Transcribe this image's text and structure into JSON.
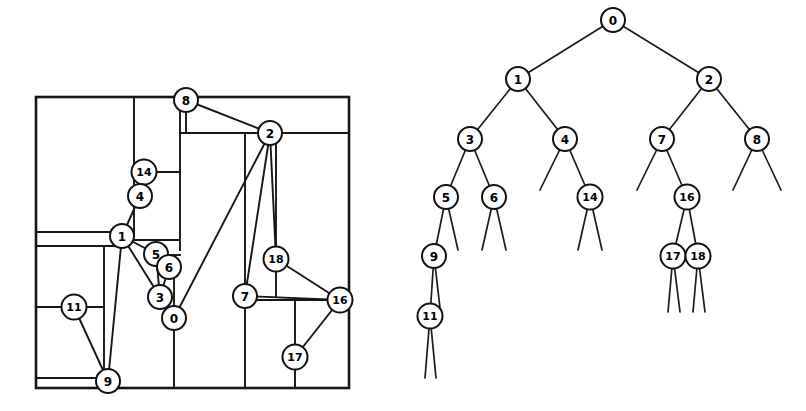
{
  "figure": {
    "width": 806,
    "height": 411,
    "background": "#ffffff",
    "ink_color": "#161616"
  },
  "layout_panel": {
    "name": "rectangular-dissection",
    "frame": {
      "x": 36,
      "y": 97,
      "width": 313,
      "height": 291
    },
    "partition_segments": [
      {
        "id": "seg-h-top-left",
        "x1": 36,
        "y1": 97,
        "x2": 180,
        "y2": 97
      },
      {
        "id": "seg-v-col-a",
        "x1": 134,
        "y1": 97,
        "x2": 134,
        "y2": 236
      },
      {
        "id": "seg-h-14-right",
        "x1": 144,
        "y1": 172,
        "x2": 180,
        "y2": 172
      },
      {
        "id": "seg-v-col-b",
        "x1": 180,
        "y1": 97,
        "x2": 180,
        "y2": 250
      },
      {
        "id": "seg-h-8-bottom",
        "x1": 180,
        "y1": 133,
        "x2": 349,
        "y2": 133
      },
      {
        "id": "seg-v-8-stub",
        "x1": 186,
        "y1": 105,
        "x2": 186,
        "y2": 133
      },
      {
        "id": "seg-h-1-left",
        "x1": 36,
        "y1": 232,
        "x2": 122,
        "y2": 232
      },
      {
        "id": "seg-h-1-left2",
        "x1": 36,
        "y1": 246,
        "x2": 122,
        "y2": 246
      },
      {
        "id": "seg-h-1-right",
        "x1": 134,
        "y1": 240,
        "x2": 180,
        "y2": 240
      },
      {
        "id": "seg-h-5-right",
        "x1": 168,
        "y1": 255,
        "x2": 180,
        "y2": 255
      },
      {
        "id": "seg-v-left-mid",
        "x1": 104,
        "y1": 246,
        "x2": 104,
        "y2": 381
      },
      {
        "id": "seg-h-11",
        "x1": 36,
        "y1": 307,
        "x2": 104,
        "y2": 307
      },
      {
        "id": "seg-v-11-box",
        "x1": 36,
        "y1": 307,
        "x2": 36,
        "y2": 388
      },
      {
        "id": "seg-v-0-col",
        "x1": 174,
        "y1": 255,
        "x2": 174,
        "y2": 388
      },
      {
        "id": "seg-v-2-col",
        "x1": 245,
        "y1": 133,
        "x2": 245,
        "y2": 388
      },
      {
        "id": "seg-v-2-right",
        "x1": 276,
        "y1": 133,
        "x2": 276,
        "y2": 296
      },
      {
        "id": "seg-h-7-16",
        "x1": 245,
        "y1": 300,
        "x2": 340,
        "y2": 300
      },
      {
        "id": "seg-v-17-col",
        "x1": 295,
        "y1": 300,
        "x2": 295,
        "y2": 388
      },
      {
        "id": "seg-h-bottom-strip",
        "x1": 36,
        "y1": 378,
        "x2": 104,
        "y2": 378
      },
      {
        "id": "seg-h-16-right",
        "x1": 340,
        "y1": 300,
        "x2": 349,
        "y2": 300
      }
    ],
    "nodes": [
      {
        "id": "8",
        "label": "8",
        "cx": 186,
        "cy": 100,
        "r": 12
      },
      {
        "id": "2",
        "label": "2",
        "cx": 270,
        "cy": 133,
        "r": 12
      },
      {
        "id": "14",
        "label": "14",
        "cx": 144,
        "cy": 172,
        "r": 12.5
      },
      {
        "id": "4",
        "label": "4",
        "cx": 140,
        "cy": 196,
        "r": 12
      },
      {
        "id": "1",
        "label": "1",
        "cx": 122,
        "cy": 236,
        "r": 12
      },
      {
        "id": "5",
        "label": "5",
        "cx": 156,
        "cy": 254,
        "r": 12
      },
      {
        "id": "6",
        "label": "6",
        "cx": 169,
        "cy": 267,
        "r": 12
      },
      {
        "id": "18",
        "label": "18",
        "cx": 276,
        "cy": 259,
        "r": 12.5
      },
      {
        "id": "3",
        "label": "3",
        "cx": 160,
        "cy": 297,
        "r": 12
      },
      {
        "id": "7",
        "label": "7",
        "cx": 245,
        "cy": 296,
        "r": 12
      },
      {
        "id": "16",
        "label": "16",
        "cx": 340,
        "cy": 300,
        "r": 12.5
      },
      {
        "id": "0",
        "label": "0",
        "cx": 174,
        "cy": 318,
        "r": 12
      },
      {
        "id": "11",
        "label": "11",
        "cx": 74,
        "cy": 307,
        "r": 12.5
      },
      {
        "id": "17",
        "label": "17",
        "cx": 295,
        "cy": 357,
        "r": 12.5
      },
      {
        "id": "9",
        "label": "9",
        "cx": 108,
        "cy": 381,
        "r": 12
      }
    ],
    "edges": [
      {
        "from": "8",
        "to": "2"
      },
      {
        "from": "2",
        "to": "7"
      },
      {
        "from": "2",
        "to": "0"
      },
      {
        "from": "2",
        "to": "18"
      },
      {
        "from": "14",
        "to": "4"
      },
      {
        "from": "4",
        "to": "1"
      },
      {
        "from": "1",
        "to": "5"
      },
      {
        "from": "1",
        "to": "3"
      },
      {
        "from": "5",
        "to": "6"
      },
      {
        "from": "5",
        "to": "3"
      },
      {
        "from": "6",
        "to": "3"
      },
      {
        "from": "3",
        "to": "0"
      },
      {
        "from": "18",
        "to": "16"
      },
      {
        "from": "7",
        "to": "16"
      },
      {
        "from": "16",
        "to": "17"
      },
      {
        "from": "11",
        "to": "9"
      },
      {
        "from": "1",
        "to": "9"
      }
    ]
  },
  "tree_panel": {
    "name": "dissection-tree",
    "nodes": [
      {
        "id": "t0",
        "label": "0",
        "cx": 613,
        "cy": 20,
        "r": 12
      },
      {
        "id": "t1",
        "label": "1",
        "cx": 518,
        "cy": 79,
        "r": 12
      },
      {
        "id": "t2",
        "label": "2",
        "cx": 709,
        "cy": 79,
        "r": 12
      },
      {
        "id": "t3",
        "label": "3",
        "cx": 470,
        "cy": 139,
        "r": 12
      },
      {
        "id": "t4",
        "label": "4",
        "cx": 565,
        "cy": 139,
        "r": 12
      },
      {
        "id": "t7",
        "label": "7",
        "cx": 662,
        "cy": 139,
        "r": 12
      },
      {
        "id": "t8",
        "label": "8",
        "cx": 757,
        "cy": 139,
        "r": 12
      },
      {
        "id": "t5",
        "label": "5",
        "cx": 446,
        "cy": 197,
        "r": 12
      },
      {
        "id": "t6",
        "label": "6",
        "cx": 494,
        "cy": 197,
        "r": 12
      },
      {
        "id": "t14",
        "label": "14",
        "cx": 590,
        "cy": 197,
        "r": 12.5
      },
      {
        "id": "t16",
        "label": "16",
        "cx": 687,
        "cy": 197,
        "r": 12.5
      },
      {
        "id": "t9",
        "label": "9",
        "cx": 434,
        "cy": 256,
        "r": 12
      },
      {
        "id": "t17",
        "label": "17",
        "cx": 673,
        "cy": 256,
        "r": 12.5
      },
      {
        "id": "t18",
        "label": "18",
        "cx": 698,
        "cy": 256,
        "r": 12.5
      },
      {
        "id": "t11",
        "label": "11",
        "cx": 430,
        "cy": 316,
        "r": 12.5
      }
    ],
    "edges": [
      {
        "from": "t0",
        "to": "t1"
      },
      {
        "from": "t0",
        "to": "t2"
      },
      {
        "from": "t1",
        "to": "t3"
      },
      {
        "from": "t1",
        "to": "t4"
      },
      {
        "from": "t2",
        "to": "t7"
      },
      {
        "from": "t2",
        "to": "t8"
      },
      {
        "from": "t3",
        "to": "t5"
      },
      {
        "from": "t3",
        "to": "t6"
      },
      {
        "from": "t4",
        "to": "t14"
      },
      {
        "from": "t7",
        "to": "t16"
      },
      {
        "from": "t5",
        "to": "t9"
      },
      {
        "from": "t16",
        "to": "t17"
      },
      {
        "from": "t16",
        "to": "t18"
      },
      {
        "from": "t9",
        "to": "t11"
      }
    ],
    "stub_edges": [
      {
        "from": "t4",
        "x2": 540,
        "y2": 190
      },
      {
        "from": "t7",
        "x2": 637,
        "y2": 190
      },
      {
        "from": "t8",
        "x2": 733,
        "y2": 190
      },
      {
        "from": "t8",
        "x2": 781,
        "y2": 190
      },
      {
        "from": "t5",
        "x2": 458,
        "y2": 250
      },
      {
        "from": "t6",
        "x2": 482,
        "y2": 250
      },
      {
        "from": "t6",
        "x2": 506,
        "y2": 250
      },
      {
        "from": "t14",
        "x2": 578,
        "y2": 250
      },
      {
        "from": "t14",
        "x2": 602,
        "y2": 250
      },
      {
        "from": "t9",
        "x2": 440,
        "y2": 308
      },
      {
        "from": "t17",
        "x2": 668,
        "y2": 312
      },
      {
        "from": "t17",
        "x2": 680,
        "y2": 312
      },
      {
        "from": "t18",
        "x2": 693,
        "y2": 312
      },
      {
        "from": "t18",
        "x2": 705,
        "y2": 312
      },
      {
        "from": "t11",
        "x2": 425,
        "y2": 378
      },
      {
        "from": "t11",
        "x2": 436,
        "y2": 378
      }
    ]
  }
}
